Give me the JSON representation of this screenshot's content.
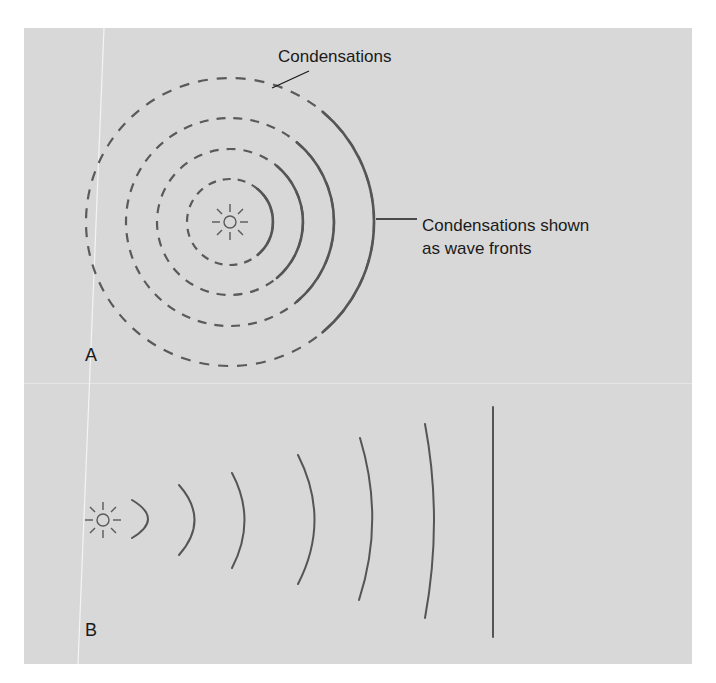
{
  "figure": {
    "panel_a": {
      "letter": "A",
      "label_condensations": "Condensations",
      "label_wave_fronts_line1": "Condensations shown",
      "label_wave_fronts_line2": "as wave fronts",
      "source_icon": "sound-source-icon",
      "circle_count": 4
    },
    "panel_b": {
      "letter": "B",
      "source_icon": "sound-source-icon",
      "wavefront_count": 7
    },
    "colors": {
      "background": "#d8d8d8",
      "stroke": "#555555",
      "text": "#1a1a1a"
    }
  }
}
